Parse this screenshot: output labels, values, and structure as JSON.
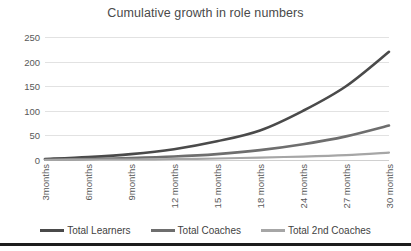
{
  "chart_data": {
    "type": "line",
    "title": "Cumulative growth in role numbers",
    "xlabel": "",
    "ylabel": "",
    "ylim": [
      0,
      250
    ],
    "yticks": [
      0,
      50,
      100,
      150,
      200,
      250
    ],
    "grid": true,
    "legend_position": "bottom",
    "categories": [
      "3months",
      "6months",
      "9months",
      "12 months",
      "15 months",
      "18 months",
      "24 months",
      "27 months",
      "30 months"
    ],
    "series": [
      {
        "name": "Total Learners",
        "color": "#4a4a4a",
        "values": [
          2,
          6,
          12,
          22,
          38,
          60,
          100,
          150,
          220
        ]
      },
      {
        "name": "Total Coaches",
        "color": "#6e6e6e",
        "values": [
          1,
          2,
          4,
          7,
          12,
          20,
          32,
          48,
          70
        ]
      },
      {
        "name": "Total 2nd Coaches",
        "color": "#a6a6a6",
        "values": [
          0,
          1,
          1,
          2,
          3,
          5,
          7,
          10,
          15
        ]
      }
    ]
  },
  "legend": {
    "items": [
      {
        "label": "Total Learners"
      },
      {
        "label": "Total Coaches"
      },
      {
        "label": "Total 2nd Coaches"
      }
    ]
  }
}
